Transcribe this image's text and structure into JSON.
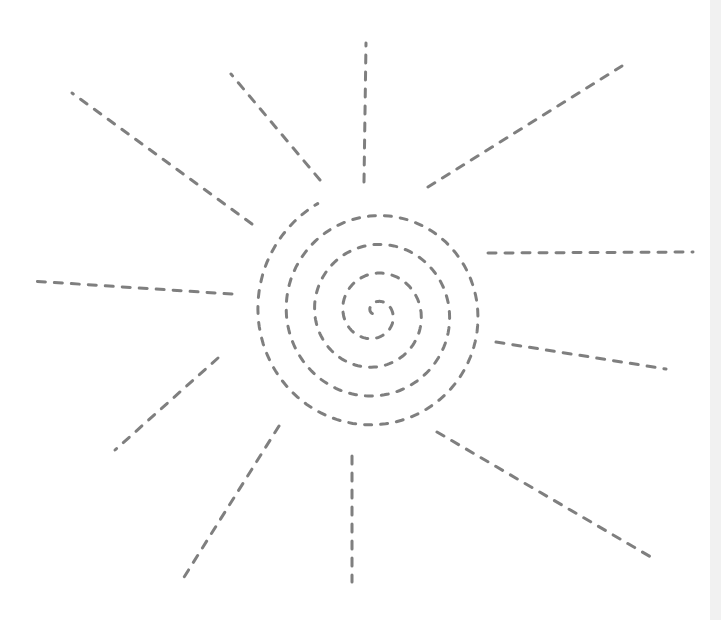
{
  "drawing": {
    "subject": "dashed sun tracing worksheet",
    "stroke_color": "#7f7f7f",
    "background": "#ffffff",
    "edge_strip_color": "#f1f1f1",
    "spiral": {
      "center": [
        375,
        313
      ],
      "turns": 4.3,
      "outer_radius_x": 122,
      "outer_radius_y": 124
    },
    "rays": [
      {
        "name": "ray-top",
        "from": [
          364,
          182
        ],
        "to": [
          366,
          43
        ]
      },
      {
        "name": "ray-top-right",
        "from": [
          428,
          187
        ],
        "to": [
          622,
          66
        ]
      },
      {
        "name": "ray-right",
        "from": [
          488,
          253
        ],
        "to": [
          693,
          252
        ]
      },
      {
        "name": "ray-lower-right",
        "from": [
          496,
          342
        ],
        "to": [
          666,
          369
        ]
      },
      {
        "name": "ray-bottom-right",
        "from": [
          437,
          432
        ],
        "to": [
          656,
          560
        ]
      },
      {
        "name": "ray-bottom",
        "from": [
          352,
          456
        ],
        "to": [
          352,
          582
        ]
      },
      {
        "name": "ray-bottom-left",
        "from": [
          279,
          426
        ],
        "to": [
          181,
          582
        ]
      },
      {
        "name": "ray-lower-left",
        "from": [
          218,
          358
        ],
        "to": [
          115,
          450
        ]
      },
      {
        "name": "ray-left",
        "from": [
          232,
          294
        ],
        "to": [
          31,
          281
        ]
      },
      {
        "name": "ray-upper-left",
        "from": [
          252,
          224
        ],
        "to": [
          72,
          93
        ]
      },
      {
        "name": "ray-top-left",
        "from": [
          320,
          180
        ],
        "to": [
          231,
          74
        ]
      }
    ]
  }
}
